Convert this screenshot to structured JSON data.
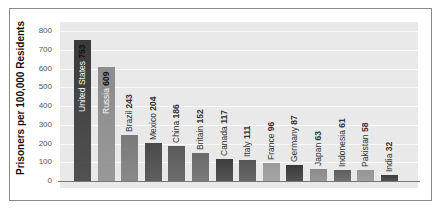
{
  "chart_data": {
    "type": "bar",
    "title": "",
    "xlabel": "",
    "ylabel": "Prisoners per 100,000 Residents",
    "ylim": [
      0,
      800
    ],
    "yticks": [
      0,
      100,
      200,
      300,
      400,
      500,
      600,
      700,
      800
    ],
    "grid": true,
    "legend": null,
    "categories": [
      "United States",
      "Russia",
      "Brazil",
      "Mexico",
      "China",
      "Britain",
      "Canada",
      "Italy",
      "France",
      "Germany",
      "Japan",
      "Indonesia",
      "Pakistan",
      "India"
    ],
    "values": [
      753,
      609,
      243,
      204,
      186,
      152,
      117,
      111,
      96,
      87,
      63,
      61,
      58,
      32
    ],
    "bar_colors": [
      "#3a3a3a",
      "#8c8c8c",
      "#7a7a7a",
      "#4a4a4a",
      "#5a5a5a",
      "#6a6a6a",
      "#3e3e3e",
      "#555555",
      "#9a9a9a",
      "#3a3a3a",
      "#8a8a8a",
      "#5e5e5e",
      "#959595",
      "#3c3c3c"
    ]
  },
  "labels": {
    "ylabel": "Prisoners per 100,000 Residents",
    "yticks": [
      "0",
      "100",
      "200",
      "300",
      "400",
      "500",
      "600",
      "700",
      "800"
    ]
  }
}
